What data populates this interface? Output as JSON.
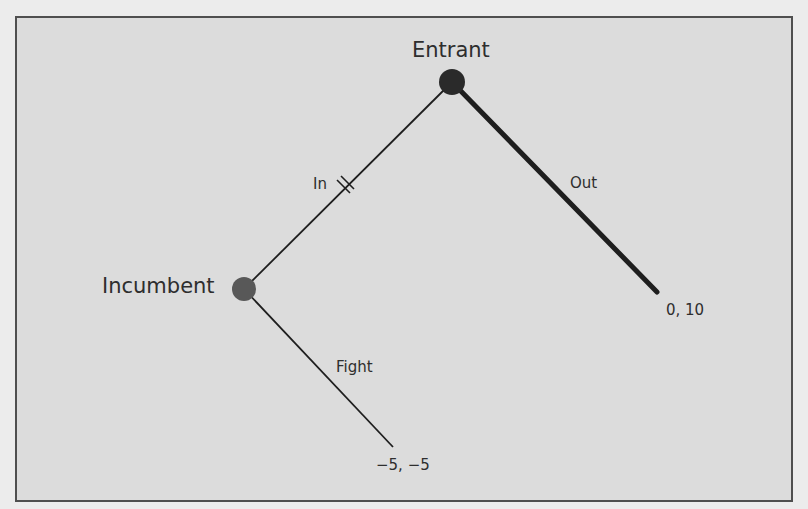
{
  "diagram": {
    "type": "extensive-form game tree",
    "nodes": [
      {
        "id": "entrant",
        "label": "Entrant",
        "color": "#2a2a2a"
      },
      {
        "id": "incumbent",
        "label": "Incumbent",
        "color": "#585858"
      }
    ],
    "branches": [
      {
        "id": "in",
        "from": "entrant",
        "to": "incumbent",
        "label": "In",
        "style": "thin",
        "marked": "double-hash"
      },
      {
        "id": "out",
        "from": "entrant",
        "to": "payoff-out",
        "label": "Out",
        "style": "thick"
      },
      {
        "id": "fight",
        "from": "incumbent",
        "to": "payoff-fight",
        "label": "Fight",
        "style": "thin"
      }
    ],
    "payoffs": [
      {
        "id": "payoff-out",
        "label": "0, 10"
      },
      {
        "id": "payoff-fight",
        "label": "−5, −5"
      }
    ]
  },
  "labels": {
    "entrant": "Entrant",
    "incumbent": "Incumbent",
    "in": "In",
    "out": "Out",
    "fight": "Fight",
    "payoff_out": "0, 10",
    "payoff_fight": "−5, −5"
  },
  "colors": {
    "background": "#dcdcdc",
    "frame_border": "#4f4f4f",
    "line": "#1e1e1e",
    "entrant_node": "#2a2a2a",
    "incumbent_node": "#585858",
    "text": "#2e2e2e"
  }
}
